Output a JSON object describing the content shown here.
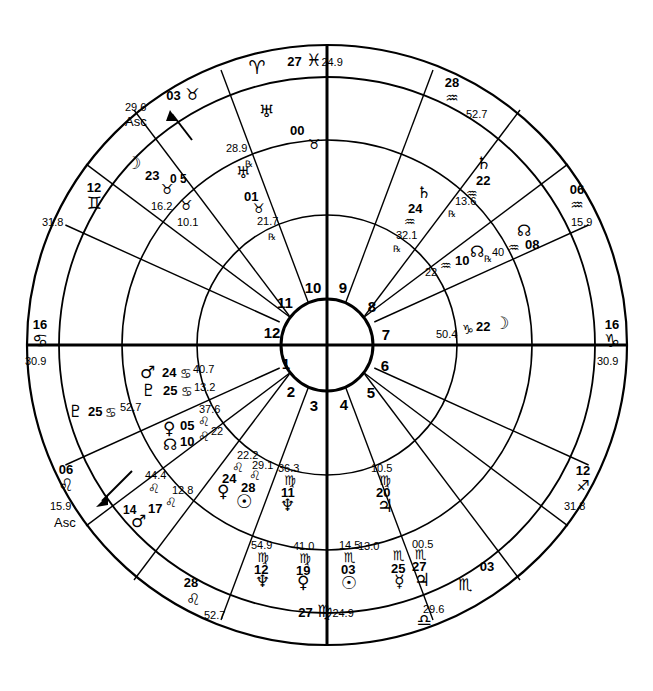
{
  "chart": {
    "type": "astrology-wheel",
    "house_numbers": [
      "1",
      "2",
      "3",
      "4",
      "5",
      "6",
      "7",
      "8",
      "9",
      "10",
      "11",
      "12"
    ],
    "cusps": [
      {
        "id": "asc-outer",
        "deg": "03",
        "sign": "♉",
        "min": "29.6",
        "label": "Asc",
        "pos": "upper-left"
      },
      {
        "id": "mc",
        "deg": "27",
        "sign": "♓",
        "min": "24.9",
        "label": "",
        "pos": "top"
      },
      {
        "id": "cusp-11-out",
        "deg": "28",
        "sign": "♒",
        "min": "52.7",
        "label": "",
        "pos": "upper-right"
      },
      {
        "id": "cusp-12-out",
        "deg": "06",
        "sign": "♒",
        "min": "15.9",
        "label": "",
        "pos": "right-upper"
      },
      {
        "id": "desc",
        "deg": "16",
        "sign": "♑",
        "min": "30.9",
        "label": "",
        "pos": "right"
      },
      {
        "id": "cusp-2-out",
        "deg": "12",
        "sign": "♐",
        "min": "31.8",
        "label": "",
        "pos": "right-lower"
      },
      {
        "id": "cusp-3-out",
        "deg": "03",
        "sign": "♏",
        "min": "29.6",
        "label": "",
        "pos": "lower-right"
      },
      {
        "id": "ic",
        "deg": "27",
        "sign": "♍",
        "min": "24.9",
        "label": "",
        "pos": "bottom"
      },
      {
        "id": "cusp-5-out",
        "deg": "28",
        "sign": "♌",
        "min": "52.7",
        "label": "",
        "pos": "lower-left"
      },
      {
        "id": "asc-inner",
        "deg": "06",
        "sign": "♌",
        "min": "15.9",
        "label": "Asc",
        "pos": "left-lower"
      },
      {
        "id": "cusp-7-out",
        "deg": "16",
        "sign": "♋",
        "min": "30.9",
        "label": "",
        "pos": "left"
      },
      {
        "id": "cusp-8-out",
        "deg": "12",
        "sign": "♊",
        "min": "31.8",
        "label": "",
        "pos": "left-upper"
      }
    ],
    "planets_outer": [
      {
        "name": "uranus",
        "glyph": "♅",
        "deg": "00",
        "sign": "♉",
        "min": "28.9",
        "retro": "℞"
      },
      {
        "name": "moon",
        "glyph": "☽",
        "deg": "23",
        "sign": "♉",
        "min": "16.2",
        "retro": ""
      },
      {
        "name": "saturn",
        "glyph": "♄",
        "deg": "22",
        "sign": "♒",
        "min": "13.6",
        "retro": "℞"
      },
      {
        "name": "node",
        "glyph": "☊",
        "deg": "08",
        "sign": "♒",
        "min": "40",
        "retro": "℞"
      },
      {
        "name": "pluto",
        "glyph": "♇",
        "deg": "25",
        "sign": "♋",
        "min": "52.7",
        "retro": ""
      },
      {
        "name": "mercury",
        "glyph": "☿",
        "deg": "25",
        "sign": "♎",
        "min": "13.0",
        "retro": ""
      },
      {
        "name": "jupiter",
        "glyph": "♃",
        "deg": "27",
        "sign": "♎",
        "min": "00.5",
        "retro": ""
      },
      {
        "name": "sun",
        "glyph": "☉",
        "deg": "03",
        "sign": "♎",
        "min": "14.5",
        "retro": ""
      },
      {
        "name": "venus",
        "glyph": "♀",
        "deg": "19",
        "sign": "♍",
        "min": "41.0",
        "retro": ""
      },
      {
        "name": "neptune",
        "glyph": "♆",
        "deg": "12",
        "sign": "♍",
        "min": "54.9",
        "retro": ""
      }
    ],
    "planets_inner": [
      {
        "name": "uranus",
        "glyph": "♅",
        "deg": "01",
        "sign": "♉",
        "min": "21.7",
        "retro": "℞"
      },
      {
        "name": "uranus-cusp",
        "glyph": "♉",
        "deg": "05",
        "sign": "",
        "min": "10.1",
        "retro": ""
      },
      {
        "name": "saturn",
        "glyph": "♄",
        "deg": "24",
        "sign": "♒",
        "min": "32.1",
        "retro": "℞"
      },
      {
        "name": "node",
        "glyph": "☊",
        "deg": "10",
        "sign": "♒",
        "min": "22",
        "retro": ""
      },
      {
        "name": "moon",
        "glyph": "☽",
        "deg": "22",
        "sign": "♑",
        "min": "50.4",
        "retro": ""
      },
      {
        "name": "mars",
        "glyph": "♂",
        "deg": "24",
        "sign": "♋",
        "min": "40.7",
        "retro": ""
      },
      {
        "name": "pluto",
        "glyph": "♇",
        "deg": "25",
        "sign": "♋",
        "min": "13.2",
        "retro": ""
      },
      {
        "name": "venus-leo",
        "glyph": "♀",
        "deg": "05",
        "sign": "♌",
        "min": "37.6",
        "retro": ""
      },
      {
        "name": "node-inner",
        "glyph": "☊",
        "deg": "10",
        "sign": "♌",
        "min": "22",
        "retro": ""
      },
      {
        "name": "venus2",
        "glyph": "♀",
        "deg": "24",
        "sign": "♌",
        "min": "22.2",
        "retro": ""
      },
      {
        "name": "sun2",
        "glyph": "☉",
        "deg": "28",
        "sign": "♌",
        "min": "29.1",
        "retro": ""
      },
      {
        "name": "neptune2",
        "glyph": "♆",
        "deg": "11",
        "sign": "♍",
        "min": "36.3",
        "retro": ""
      },
      {
        "name": "jupiter2",
        "glyph": "♃",
        "deg": "20",
        "sign": "♍",
        "min": "10.5",
        "retro": ""
      },
      {
        "name": "asc-mars",
        "glyph": "♂",
        "deg": "17",
        "sign": "♌",
        "min": "12.8",
        "retro": ""
      },
      {
        "name": "asc-point",
        "glyph": "",
        "deg": "14",
        "sign": "♌",
        "min": "44.4",
        "retro": ""
      }
    ]
  },
  "labels": {
    "mc_deg": "27",
    "mc_sign": "♓",
    "mc_min": "24.9",
    "ic_deg": "27",
    "ic_sign": "♍",
    "ic_min": "24.9",
    "asc_text": "Asc",
    "aries": "♈",
    "libra_bottom": "♎",
    "gemini_left": "♊",
    "cancer_left": "♋",
    "leo_left": "♌",
    "leo_lower": "♌",
    "scorpio_lower": "♏",
    "sagittarius_right": "♐",
    "capricorn_right": "♑",
    "aquarius_upper": "♒",
    "aquarius_upper2": "♒",
    "taurus_top": "♉"
  }
}
